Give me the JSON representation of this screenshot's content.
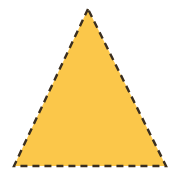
{
  "shape": {
    "type": "triangle",
    "kind": "isosceles",
    "vertices": [
      [
        88,
        9
      ],
      [
        14,
        166
      ],
      [
        166,
        166
      ]
    ],
    "fill": "#FBC74A",
    "stroke": "#3A2E1F",
    "stroke_width": 2.4,
    "stroke_dash": "7 5"
  }
}
